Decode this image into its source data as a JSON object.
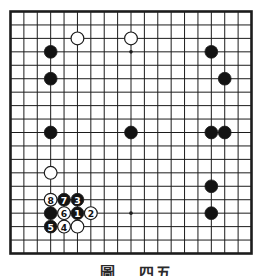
{
  "board": {
    "size": 19,
    "grid_color": "#1c1c1c",
    "paper_color": "#ffffff",
    "stone_black_color": "#131313",
    "stone_white_color": "#ffffff",
    "star_points": [
      [
        4,
        4
      ],
      [
        10,
        4
      ],
      [
        16,
        4
      ],
      [
        4,
        10
      ],
      [
        10,
        10
      ],
      [
        16,
        10
      ],
      [
        4,
        16
      ],
      [
        10,
        16
      ],
      [
        16,
        16
      ]
    ],
    "plain_black_stones": [
      [
        4,
        4
      ],
      [
        4,
        6
      ],
      [
        16,
        4
      ],
      [
        17,
        6
      ],
      [
        4,
        10
      ],
      [
        10,
        10
      ],
      [
        16,
        10
      ],
      [
        17,
        10
      ],
      [
        16,
        14
      ],
      [
        16,
        16
      ],
      [
        4,
        16
      ]
    ],
    "plain_white_stones": [
      [
        6,
        3
      ],
      [
        10,
        3
      ],
      [
        4,
        13
      ],
      [
        6,
        17
      ]
    ],
    "moves": [
      {
        "n": "1",
        "color": "black",
        "pos": [
          6,
          16
        ]
      },
      {
        "n": "2",
        "color": "white",
        "pos": [
          7,
          16
        ]
      },
      {
        "n": "3",
        "color": "black",
        "pos": [
          6,
          15
        ]
      },
      {
        "n": "4",
        "color": "white",
        "pos": [
          5,
          17
        ]
      },
      {
        "n": "5",
        "color": "black",
        "pos": [
          4,
          17
        ]
      },
      {
        "n": "6",
        "color": "white",
        "pos": [
          5,
          16
        ]
      },
      {
        "n": "7",
        "color": "black",
        "pos": [
          5,
          15
        ]
      },
      {
        "n": "8",
        "color": "white",
        "pos": [
          4,
          15
        ]
      }
    ]
  },
  "caption": {
    "left": "圖",
    "right": "四五"
  }
}
